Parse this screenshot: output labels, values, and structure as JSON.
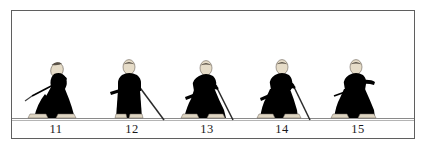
{
  "plate": {
    "title": "",
    "background_color": "#ffffff",
    "frame_color": "#5f5f5f",
    "ground_line_color": "#8a8a8a",
    "figure_body_color": "#000000",
    "figure_head_color": "#e6dcc8",
    "figure_foot_color": "#ded5c2",
    "sword_color": "#4a4a4a",
    "caption_color": "#1a1a1a"
  },
  "figures": [
    {
      "number": "11",
      "pose": "crouching-low-with-hand-raised-to-face",
      "facing": "right",
      "has_sword": true,
      "sword_direction": "upper-left-behind"
    },
    {
      "number": "12",
      "pose": "standing-upright",
      "facing": "right",
      "has_sword": true,
      "sword_direction": "forward-down-to-ground"
    },
    {
      "number": "13",
      "pose": "kneeling-forward-lunge",
      "facing": "right",
      "has_sword": true,
      "sword_direction": "forward-down-to-ground"
    },
    {
      "number": "14",
      "pose": "kneeling-upright",
      "facing": "right",
      "has_sword": true,
      "sword_direction": "forward-down-to-ground"
    },
    {
      "number": "15",
      "pose": "kneeling-with-arm-extended-forward",
      "facing": "right",
      "has_sword": true,
      "sword_direction": "held-horizontal-at-side"
    }
  ]
}
